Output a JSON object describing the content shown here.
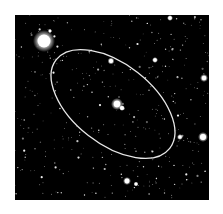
{
  "image": {
    "description": "Deep-sky star field with an elliptical aperture outline around a central galaxy",
    "background_color": "#000000",
    "frame_color": "#ffffff",
    "ellipse": {
      "cx": 98,
      "cy": 89,
      "rx": 72,
      "ry": 40,
      "rotation_deg": 38,
      "stroke": "#e8e8e8",
      "stroke_width": 1.3
    },
    "bright_stars": [
      {
        "x": 29,
        "y": 26,
        "r": 6.5,
        "glow": 11
      },
      {
        "x": 102,
        "y": 89,
        "r": 3.2,
        "glow": 6
      },
      {
        "x": 107,
        "y": 93,
        "r": 2,
        "glow": 3
      },
      {
        "x": 188,
        "y": 122,
        "r": 3,
        "glow": 5
      },
      {
        "x": 189,
        "y": 63,
        "r": 2.2,
        "glow": 4
      },
      {
        "x": 155,
        "y": 3,
        "r": 1.8,
        "glow": 3
      },
      {
        "x": 112,
        "y": 166,
        "r": 2.4,
        "glow": 4
      },
      {
        "x": 96,
        "y": 46,
        "r": 2,
        "glow": 3.5
      },
      {
        "x": 140,
        "y": 45,
        "r": 1.8,
        "glow": 3
      },
      {
        "x": 165,
        "y": 122,
        "r": 1.6,
        "glow": 3
      },
      {
        "x": 35,
        "y": 16,
        "r": 1.4,
        "glow": 2
      },
      {
        "x": 121,
        "y": 169,
        "r": 1.5,
        "glow": 2.5
      }
    ],
    "star_seed": 7,
    "faint_star_count": 420
  }
}
